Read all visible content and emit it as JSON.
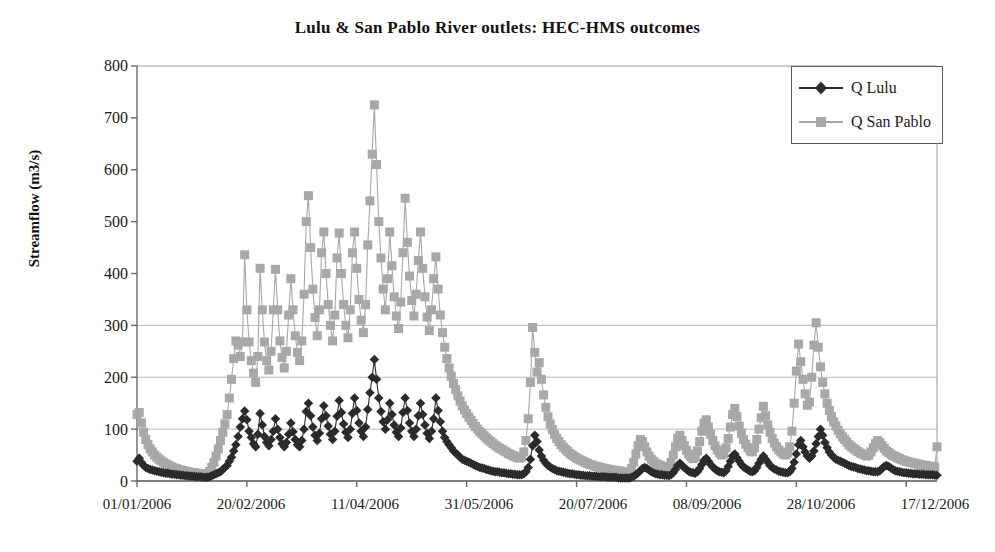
{
  "chart": {
    "title": "Lulu & San Pablo River outlets:  HEC-HMS outcomes",
    "y_axis_title": "Streamflow (m3/s)",
    "y_tick_labels": [
      "800",
      "700",
      "600",
      "500",
      "400",
      "300",
      "200",
      "100",
      "0"
    ],
    "x_tick_labels": [
      "01/01/2006",
      "20/02/2006",
      "11/04/2006",
      "31/05/2006",
      "20/07/2006",
      "08/09/2006",
      "28/10/2006",
      "17/12/2006"
    ],
    "legend": {
      "items": [
        {
          "label": "Q Lulu",
          "color": "#2b2b2b",
          "marker": "diamond-marker"
        },
        {
          "label": "Q San Pablo",
          "color": "#a8a8a8",
          "marker": "square-marker"
        }
      ]
    }
  },
  "chart_data": {
    "type": "line",
    "title": "Lulu & San Pablo River outlets:  HEC-HMS outcomes",
    "xlabel": "",
    "ylabel": "Streamflow (m3/s)",
    "ylim": [
      0,
      800
    ],
    "yticks": [
      0,
      100,
      200,
      300,
      400,
      500,
      600,
      700,
      800
    ],
    "gridlines_y": [
      100,
      200,
      300
    ],
    "grid": true,
    "legend_position": "top-right",
    "x_type": "date",
    "x_start": "01/01/2006",
    "x_end": "31/12/2006",
    "x_tick_dates": [
      "01/01/2006",
      "20/02/2006",
      "11/04/2006",
      "31/05/2006",
      "20/07/2006",
      "08/09/2006",
      "28/10/2006",
      "17/12/2006"
    ],
    "x_tick_day_index": [
      0,
      50,
      100,
      150,
      200,
      250,
      300,
      350
    ],
    "n_points": 365,
    "series": [
      {
        "name": "Q Lulu",
        "color": "#2b2b2b",
        "marker": "diamond",
        "values": [
          38,
          44,
          36,
          30,
          26,
          24,
          22,
          21,
          20,
          19,
          18,
          17,
          16,
          15,
          15,
          14,
          13,
          13,
          12,
          12,
          11,
          11,
          10,
          10,
          9,
          9,
          9,
          8,
          8,
          8,
          7,
          7,
          7,
          8,
          10,
          12,
          14,
          16,
          18,
          22,
          26,
          30,
          38,
          46,
          58,
          70,
          86,
          104,
          120,
          135,
          118,
          96,
          84,
          72,
          66,
          90,
          130,
          108,
          86,
          74,
          68,
          80,
          96,
          120,
          100,
          84,
          72,
          66,
          74,
          90,
          112,
          95,
          80,
          70,
          66,
          78,
          100,
          134,
          150,
          126,
          104,
          88,
          78,
          92,
          120,
          145,
          126,
          106,
          90,
          80,
          96,
          125,
          155,
          132,
          110,
          94,
          84,
          100,
          130,
          160,
          136,
          112,
          96,
          86,
          104,
          138,
          170,
          200,
          234,
          196,
          160,
          134,
          114,
          100,
          118,
          150,
          128,
          108,
          94,
          86,
          102,
          132,
          160,
          136,
          112,
          96,
          86,
          100,
          126,
          150,
          128,
          108,
          92,
          82,
          96,
          120,
          160,
          136,
          114,
          96,
          84,
          76,
          70,
          64,
          58,
          54,
          50,
          46,
          42,
          40,
          38,
          36,
          34,
          32,
          30,
          28,
          26,
          25,
          24,
          22,
          21,
          20,
          19,
          18,
          18,
          17,
          16,
          16,
          15,
          14,
          14,
          13,
          13,
          12,
          12,
          12,
          14,
          18,
          26,
          42,
          68,
          88,
          76,
          60,
          48,
          40,
          34,
          30,
          27,
          24,
          22,
          20,
          19,
          18,
          17,
          16,
          15,
          14,
          14,
          13,
          12,
          12,
          11,
          11,
          10,
          10,
          10,
          9,
          9,
          9,
          8,
          8,
          8,
          8,
          7,
          7,
          7,
          7,
          7,
          6,
          6,
          6,
          6,
          6,
          6,
          7,
          9,
          12,
          16,
          20,
          24,
          26,
          24,
          21,
          18,
          16,
          14,
          13,
          12,
          12,
          11,
          11,
          10,
          12,
          16,
          22,
          30,
          34,
          30,
          26,
          22,
          19,
          17,
          16,
          15,
          18,
          24,
          32,
          40,
          44,
          38,
          32,
          27,
          23,
          20,
          18,
          17,
          16,
          20,
          28,
          38,
          48,
          52,
          45,
          38,
          32,
          27,
          24,
          21,
          19,
          18,
          20,
          26,
          34,
          42,
          48,
          42,
          36,
          30,
          26,
          23,
          21,
          19,
          18,
          17,
          16,
          16,
          18,
          24,
          36,
          52,
          70,
          78,
          66,
          56,
          48,
          44,
          48,
          58,
          72,
          86,
          100,
          88,
          74,
          64,
          56,
          50,
          46,
          42,
          40,
          38,
          36,
          34,
          32,
          30,
          28,
          27,
          26,
          24,
          23,
          22,
          21,
          20,
          20,
          19,
          18,
          18,
          18,
          20,
          24,
          28,
          30,
          28,
          25,
          22,
          20,
          19,
          18,
          17,
          16,
          16,
          15,
          15,
          14,
          14,
          14,
          13,
          13,
          13,
          12,
          12,
          12,
          12,
          11,
          11
        ]
      },
      {
        "name": "Q San Pablo",
        "color": "#a8a8a8",
        "marker": "square",
        "values": [
          128,
          132,
          112,
          94,
          80,
          70,
          62,
          56,
          50,
          46,
          42,
          39,
          36,
          33,
          31,
          29,
          27,
          25,
          24,
          22,
          21,
          20,
          19,
          18,
          17,
          16,
          16,
          15,
          14,
          14,
          13,
          13,
          14,
          18,
          26,
          36,
          48,
          62,
          78,
          94,
          110,
          128,
          160,
          196,
          236,
          270,
          262,
          240,
          268,
          436,
          330,
          268,
          232,
          208,
          190,
          240,
          410,
          330,
          268,
          232,
          214,
          250,
          330,
          408,
          330,
          270,
          238,
          218,
          250,
          320,
          390,
          330,
          280,
          248,
          232,
          270,
          360,
          500,
          550,
          450,
          370,
          315,
          280,
          330,
          440,
          480,
          400,
          340,
          300,
          270,
          320,
          430,
          478,
          400,
          340,
          300,
          276,
          330,
          440,
          480,
          410,
          350,
          310,
          286,
          340,
          455,
          540,
          630,
          725,
          610,
          500,
          430,
          370,
          330,
          390,
          480,
          415,
          355,
          318,
          294,
          345,
          440,
          545,
          460,
          395,
          348,
          318,
          360,
          425,
          480,
          410,
          355,
          316,
          290,
          330,
          390,
          432,
          370,
          320,
          286,
          258,
          236,
          218,
          202,
          188,
          176,
          164,
          154,
          145,
          137,
          130,
          123,
          117,
          111,
          105,
          100,
          95,
          91,
          87,
          83,
          79,
          76,
          72,
          69,
          66,
          63,
          61,
          58,
          56,
          53,
          51,
          49,
          47,
          45,
          44,
          46,
          56,
          78,
          120,
          190,
          296,
          248,
          210,
          228,
          196,
          166,
          142,
          124,
          110,
          99,
          90,
          82,
          76,
          70,
          65,
          61,
          57,
          53,
          50,
          47,
          44,
          42,
          40,
          38,
          36,
          34,
          32,
          31,
          29,
          28,
          27,
          26,
          25,
          24,
          23,
          22,
          21,
          21,
          20,
          19,
          19,
          18,
          18,
          17,
          18,
          24,
          36,
          52,
          68,
          80,
          76,
          66,
          56,
          48,
          42,
          38,
          34,
          32,
          30,
          28,
          27,
          26,
          28,
          36,
          50,
          66,
          82,
          88,
          78,
          68,
          59,
          52,
          47,
          43,
          46,
          58,
          76,
          96,
          112,
          118,
          104,
          90,
          78,
          68,
          60,
          54,
          50,
          52,
          64,
          82,
          104,
          128,
          140,
          124,
          106,
          92,
          80,
          71,
          64,
          58,
          56,
          64,
          80,
          100,
          122,
          144,
          126,
          108,
          94,
          82,
          73,
          66,
          60,
          56,
          52,
          50,
          54,
          66,
          96,
          150,
          212,
          264,
          230,
          196,
          168,
          146,
          152,
          200,
          262,
          305,
          258,
          220,
          190,
          168,
          150,
          136,
          124,
          114,
          106,
          98,
          91,
          85,
          80,
          75,
          70,
          66,
          63,
          60,
          57,
          54,
          52,
          50,
          48,
          50,
          56,
          64,
          72,
          78,
          74,
          68,
          63,
          58,
          55,
          52,
          49,
          47,
          45,
          43,
          41,
          40,
          38,
          37,
          36,
          35,
          34,
          33,
          32,
          31,
          30,
          30,
          29,
          28,
          28,
          27,
          66
        ]
      }
    ]
  }
}
